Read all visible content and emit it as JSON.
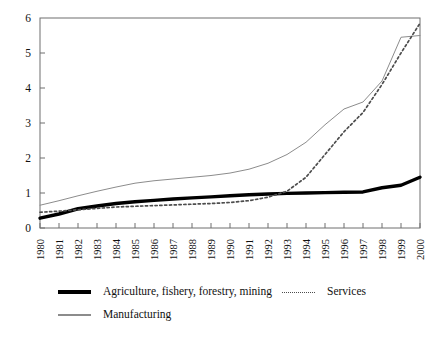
{
  "chart_data": {
    "type": "line",
    "title": "",
    "subtitle": "",
    "xlabel": "",
    "ylabel": "",
    "xlim": [
      1980,
      2000
    ],
    "ylim": [
      0,
      6
    ],
    "yticks": [
      0,
      1,
      2,
      3,
      4,
      5,
      6
    ],
    "ytick_labels": [
      "0",
      "1",
      "2",
      "3",
      "4",
      "5",
      "6"
    ],
    "grid": false,
    "legend_position": "below-plot",
    "x": [
      1980,
      1981,
      1982,
      1983,
      1984,
      1985,
      1986,
      1987,
      1988,
      1989,
      1990,
      1991,
      1992,
      1993,
      1994,
      1995,
      1996,
      1997,
      1998,
      1999,
      2000
    ],
    "xtick_labels": [
      "1980",
      "1981",
      "1982",
      "1983",
      "1984",
      "1985",
      "1986",
      "1987",
      "1988",
      "1989",
      "1990",
      "1991",
      "1992",
      "1993",
      "1994",
      "1995",
      "1996",
      "1997",
      "1998",
      "1999",
      "2000"
    ],
    "series": [
      {
        "name": "Agriculture, fishery, forestry, mining",
        "style": "thick-solid",
        "color": "#000000",
        "values": [
          0.28,
          0.4,
          0.55,
          0.63,
          0.7,
          0.75,
          0.79,
          0.83,
          0.86,
          0.89,
          0.92,
          0.95,
          0.97,
          0.99,
          1.0,
          1.01,
          1.02,
          1.03,
          1.15,
          1.22,
          1.45
        ]
      },
      {
        "name": "Manufacturing",
        "style": "thin-solid",
        "color": "#8c8c8c",
        "values": [
          0.65,
          0.78,
          0.92,
          1.05,
          1.17,
          1.28,
          1.35,
          1.4,
          1.45,
          1.5,
          1.57,
          1.68,
          1.85,
          2.1,
          2.45,
          2.95,
          3.4,
          3.6,
          4.2,
          5.45,
          5.5
        ]
      },
      {
        "name": "Services",
        "style": "dotted",
        "color": "#4d4d4d",
        "values": [
          0.45,
          0.48,
          0.52,
          0.56,
          0.6,
          0.62,
          0.64,
          0.66,
          0.68,
          0.7,
          0.73,
          0.78,
          0.88,
          1.05,
          1.45,
          2.1,
          2.75,
          3.3,
          4.1,
          5.0,
          5.85
        ]
      }
    ]
  },
  "legend": {
    "items": [
      {
        "label": "Agriculture, fishery, forestry, mining",
        "style": "thick-solid"
      },
      {
        "label": "Manufacturing",
        "style": "thin-solid"
      },
      {
        "label": "Services",
        "style": "dotted"
      }
    ]
  }
}
